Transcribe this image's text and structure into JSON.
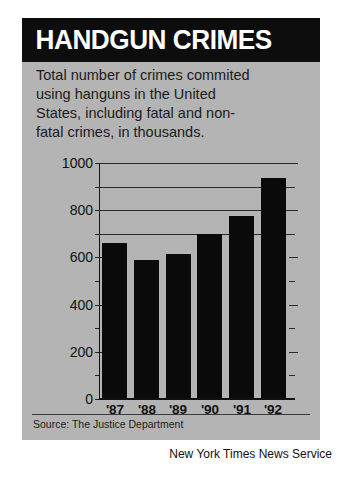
{
  "header": {
    "title": "HANDGUN CRIMES"
  },
  "subtitle": {
    "lines": [
      "Total number of crimes commited",
      "using hanguns in the United",
      "States, including fatal and non-",
      "fatal crimes, in thousands."
    ]
  },
  "source": {
    "label": "Source: The Justice Department"
  },
  "credit": {
    "label": "New York Times News Service"
  },
  "colors": {
    "panel": "#b4b4b4",
    "banner": "#0d0d0d",
    "bar": "#0a0a0a",
    "gridline": "#2a2a2a",
    "text": "#1b1b1b"
  },
  "chart_data": {
    "type": "bar",
    "title": "HANDGUN CRIMES",
    "subtitle": "Total number of crimes commited using hanguns in the United States, including fatal and non-fatal crimes, in thousands.",
    "categories": [
      "'87",
      "'88",
      "'89",
      "'90",
      "'91",
      "'92"
    ],
    "values": [
      660,
      590,
      615,
      700,
      775,
      935
    ],
    "xlabel": "",
    "ylabel": "",
    "ylim": [
      0,
      1000
    ],
    "ytick_labels": [
      "0",
      "200",
      "400",
      "600",
      "800",
      "1000"
    ],
    "ytick_values": [
      0,
      200,
      400,
      600,
      800,
      1000
    ],
    "yminor_values": [
      100,
      300,
      500,
      700,
      900
    ],
    "gridline_values": [
      700,
      800,
      900,
      1000
    ],
    "grid": true,
    "legend": "none",
    "source": "Source: The Justice Department",
    "units": "thousands"
  }
}
